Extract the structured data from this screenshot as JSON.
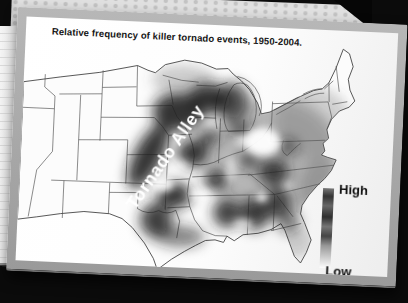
{
  "slide": {
    "title": "Relative frequency of killer tornado events, 1950-2004."
  },
  "map": {
    "region_label": "Tornado Alley",
    "type": "density-map-grayscale",
    "high_frequency_areas": [
      "Tornado Alley corridor (Nebraska-Kansas-Oklahoma-NE Texas)",
      "Iowa / southern Minnesota / Wisconsin",
      "Missouri / Arkansas",
      "Lower Mississippi valley / Louisiana",
      "Alabama / Georgia / Tennessee-Kentucky"
    ],
    "low_frequency_areas": [
      "Western mountain states",
      "Northeast / New England",
      "Florida peninsula"
    ]
  },
  "legend": {
    "high_label": "High",
    "low_label": "Low"
  },
  "colors": {
    "background": "#0b0b0b",
    "slide_frame": "#a7a7a7",
    "slide_paper": "#ffffff",
    "shading_dark": "#1e1e1e",
    "texture_band": "#e0e0e0",
    "notebook_paper": "#f1f1f1"
  }
}
